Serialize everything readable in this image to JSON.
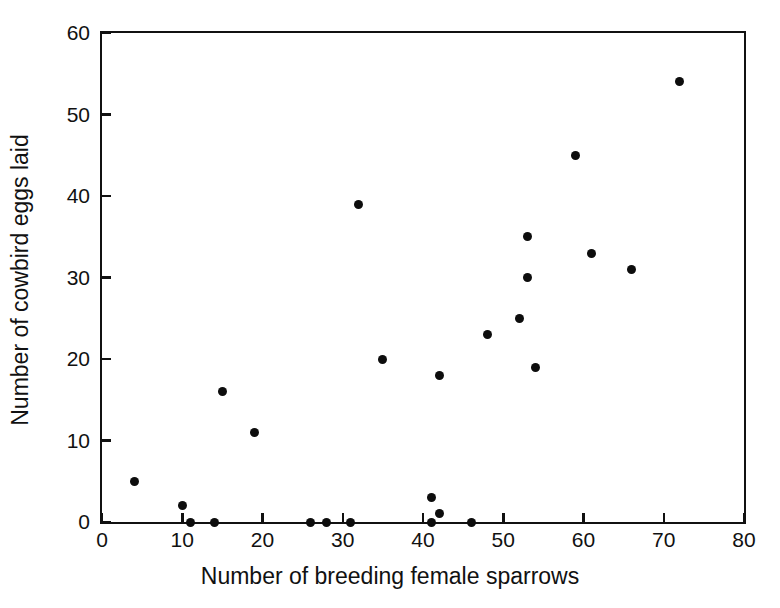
{
  "chart_data": {
    "type": "scatter",
    "title": "",
    "xlabel": "Number of breeding female sparrows",
    "ylabel": "Number of cowbird eggs laid",
    "xlim": [
      0,
      80
    ],
    "ylim": [
      0,
      60
    ],
    "xticks": [
      0,
      10,
      20,
      30,
      40,
      50,
      60,
      70,
      80
    ],
    "yticks": [
      0,
      10,
      20,
      30,
      40,
      50,
      60
    ],
    "xticklabels": [
      "0",
      "10",
      "20",
      "30",
      "40",
      "50",
      "60",
      "70",
      "80"
    ],
    "yticklabels": [
      "0",
      "10",
      "20",
      "30",
      "40",
      "50",
      "60"
    ],
    "grid": false,
    "legend": false,
    "marker": "filled-circle",
    "marker_color": "#0d0d0d",
    "marker_size": 9,
    "frame_color": "#111111",
    "background_color": "#ffffff",
    "n_points": 26,
    "points": [
      {
        "x": 4,
        "y": 5
      },
      {
        "x": 10,
        "y": 2
      },
      {
        "x": 11,
        "y": 0
      },
      {
        "x": 14,
        "y": 0
      },
      {
        "x": 15,
        "y": 16
      },
      {
        "x": 19,
        "y": 11
      },
      {
        "x": 26,
        "y": 0
      },
      {
        "x": 28,
        "y": 0
      },
      {
        "x": 31,
        "y": 0
      },
      {
        "x": 32,
        "y": 39
      },
      {
        "x": 35,
        "y": 20
      },
      {
        "x": 41,
        "y": 3
      },
      {
        "x": 41,
        "y": 0
      },
      {
        "x": 42,
        "y": 1
      },
      {
        "x": 42,
        "y": 18
      },
      {
        "x": 46,
        "y": 0
      },
      {
        "x": 48,
        "y": 23
      },
      {
        "x": 52,
        "y": 25
      },
      {
        "x": 53,
        "y": 35
      },
      {
        "x": 53,
        "y": 30
      },
      {
        "x": 54,
        "y": 19
      },
      {
        "x": 59,
        "y": 45
      },
      {
        "x": 61,
        "y": 33
      },
      {
        "x": 66,
        "y": 31
      },
      {
        "x": 72,
        "y": 54
      }
    ]
  }
}
